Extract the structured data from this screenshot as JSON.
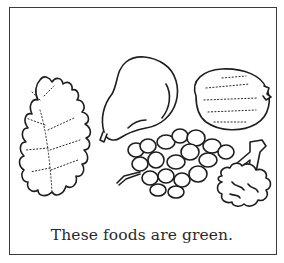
{
  "worksheet": {
    "caption": "These foods are green.",
    "items": [
      {
        "name": "lettuce",
        "icon": "lettuce-leaf-icon"
      },
      {
        "name": "pear",
        "icon": "pear-icon"
      },
      {
        "name": "lime",
        "icon": "lime-icon"
      },
      {
        "name": "grapes",
        "icon": "grapes-icon"
      },
      {
        "name": "broccoli",
        "icon": "broccoli-icon"
      }
    ],
    "colors": {
      "ink": "#1e1e1e",
      "paper": "#ffffff",
      "border": "#3a3a3a"
    }
  }
}
